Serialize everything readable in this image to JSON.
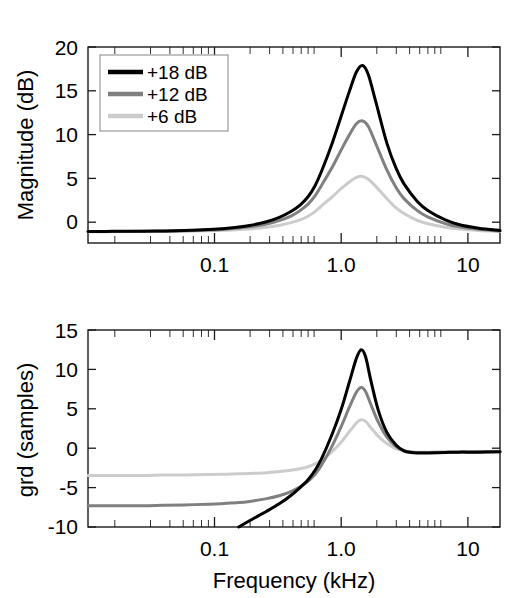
{
  "chart_data": [
    {
      "type": "line",
      "id": "magnitude-response",
      "title": "",
      "xlabel": "",
      "ylabel": "Magnitude (dB)",
      "xscale": "log",
      "xlim": [
        0.02,
        20
      ],
      "ylim": [
        -1.2,
        20
      ],
      "xticks": [
        0.1,
        1.0,
        10
      ],
      "xticklabels": [
        "0.1",
        "1.0",
        "10"
      ],
      "yticks": [
        0,
        5,
        10,
        15,
        20
      ],
      "yticklabels": [
        "0",
        "5",
        "10",
        "15",
        "20"
      ],
      "grid": false,
      "legend_position": "upper left",
      "legend_entries": [
        "+18 dB",
        "+12 dB",
        "+6 dB"
      ],
      "x": [
        0.02,
        0.03,
        0.05,
        0.07,
        0.1,
        0.15,
        0.2,
        0.3,
        0.4,
        0.5,
        0.6,
        0.7,
        0.8,
        0.9,
        1.0,
        1.2,
        1.4,
        1.6,
        1.8,
        2.0,
        2.2,
        2.5,
        3.0,
        3.5,
        4.0,
        5.0,
        6.0,
        8.0,
        10.0,
        14.0,
        20.0
      ],
      "series": [
        {
          "name": "+18 dB",
          "color": "#000000",
          "linewidth": 3.0,
          "values": [
            0.05,
            0.06,
            0.08,
            0.1,
            0.15,
            0.25,
            0.38,
            0.7,
            1.1,
            1.6,
            2.2,
            2.9,
            3.8,
            5.0,
            6.5,
            9.6,
            12.6,
            15.2,
            17.3,
            18.0,
            17.0,
            14.0,
            9.6,
            6.9,
            5.2,
            3.3,
            2.3,
            1.3,
            0.8,
            0.4,
            0.15
          ]
        },
        {
          "name": "+12 dB",
          "color": "#808080",
          "linewidth": 3.0,
          "values": [
            0.04,
            0.05,
            0.06,
            0.08,
            0.12,
            0.2,
            0.3,
            0.55,
            0.85,
            1.25,
            1.7,
            2.3,
            3.0,
            3.9,
            5.0,
            7.0,
            8.9,
            10.5,
            11.7,
            12.0,
            11.4,
            9.5,
            6.7,
            4.8,
            3.6,
            2.3,
            1.6,
            0.9,
            0.55,
            0.28,
            0.1
          ]
        },
        {
          "name": "+6 dB",
          "color": "#cccccc",
          "linewidth": 3.0,
          "values": [
            0.02,
            0.03,
            0.04,
            0.05,
            0.07,
            0.12,
            0.18,
            0.32,
            0.5,
            0.72,
            1.0,
            1.3,
            1.7,
            2.2,
            2.8,
            3.8,
            4.7,
            5.4,
            5.9,
            6.0,
            5.7,
            4.9,
            3.6,
            2.6,
            2.0,
            1.25,
            0.88,
            0.5,
            0.3,
            0.15,
            0.06
          ]
        }
      ]
    },
    {
      "type": "line",
      "id": "group-delay-response",
      "title": "",
      "xlabel": "Frequency (kHz)",
      "ylabel": "grd (samples)",
      "xscale": "log",
      "xlim": [
        0.02,
        20
      ],
      "ylim": [
        -10,
        15
      ],
      "xticks": [
        0.1,
        1.0,
        10
      ],
      "xticklabels": [
        "0.1",
        "1.0",
        "10"
      ],
      "yticks": [
        -10,
        -5,
        0,
        5,
        10,
        15
      ],
      "yticklabels": [
        "-10",
        "-5",
        "0",
        "5",
        "10",
        "15"
      ],
      "grid": false,
      "x": [
        0.02,
        0.03,
        0.05,
        0.07,
        0.1,
        0.15,
        0.2,
        0.25,
        0.3,
        0.4,
        0.5,
        0.6,
        0.7,
        0.8,
        0.9,
        1.0,
        1.2,
        1.4,
        1.6,
        1.8,
        1.95,
        2.1,
        2.3,
        2.6,
        3.0,
        3.5,
        4.0,
        4.5,
        5.0,
        6.0,
        8.0,
        10.0,
        14.0,
        20.0
      ],
      "series": [
        {
          "name": "+18 dB",
          "color": "#000000",
          "linewidth": 3.0,
          "values": [
            null,
            null,
            null,
            null,
            null,
            null,
            null,
            -10.0,
            -9.2,
            -8.0,
            -7.0,
            -6.0,
            -5.0,
            -4.0,
            -2.8,
            -1.4,
            1.8,
            5.0,
            8.4,
            11.4,
            12.5,
            11.6,
            8.5,
            4.8,
            2.0,
            0.4,
            -0.35,
            -0.55,
            -0.6,
            -0.6,
            -0.55,
            -0.5,
            -0.5,
            -0.45
          ]
        },
        {
          "name": "+12 dB",
          "color": "#808080",
          "linewidth": 3.0,
          "values": [
            -7.3,
            -7.3,
            -7.3,
            -7.25,
            -7.2,
            -7.1,
            -7.0,
            -6.9,
            -6.75,
            -6.4,
            -6.0,
            -5.5,
            -4.9,
            -4.2,
            -3.3,
            -2.2,
            0.3,
            2.8,
            5.2,
            7.1,
            7.7,
            7.2,
            5.5,
            3.3,
            1.4,
            0.2,
            -0.35,
            -0.5,
            -0.55,
            -0.55,
            -0.5,
            -0.5,
            -0.45,
            -0.45
          ]
        },
        {
          "name": "+6 dB",
          "color": "#cccccc",
          "linewidth": 3.0,
          "values": [
            -3.45,
            -3.45,
            -3.45,
            -3.4,
            -3.4,
            -3.35,
            -3.3,
            -3.25,
            -3.2,
            -3.1,
            -2.95,
            -2.8,
            -2.6,
            -2.35,
            -2.0,
            -1.55,
            -0.4,
            0.8,
            2.1,
            3.2,
            3.6,
            3.4,
            2.6,
            1.5,
            0.6,
            -0.05,
            -0.35,
            -0.45,
            -0.5,
            -0.5,
            -0.5,
            -0.45,
            -0.45,
            -0.4
          ]
        }
      ]
    }
  ],
  "legend": {
    "entries": [
      {
        "label": "+18 dB",
        "color": "#000000"
      },
      {
        "label": "+12 dB",
        "color": "#808080"
      },
      {
        "label": "+6 dB",
        "color": "#cccccc"
      }
    ]
  },
  "top_panel": {
    "ylabel": "Magnitude (dB)",
    "yticklabels": [
      "20",
      "15",
      "10",
      "5",
      "0"
    ],
    "xticklabels": [
      "0.1",
      "1.0",
      "10"
    ]
  },
  "bottom_panel": {
    "ylabel": "grd (samples)",
    "xlabel": "Frequency (kHz)",
    "yticklabels": [
      "15",
      "10",
      "5",
      "0",
      "-5",
      "-10"
    ],
    "xticklabels": [
      "0.1",
      "1.0",
      "10"
    ]
  }
}
